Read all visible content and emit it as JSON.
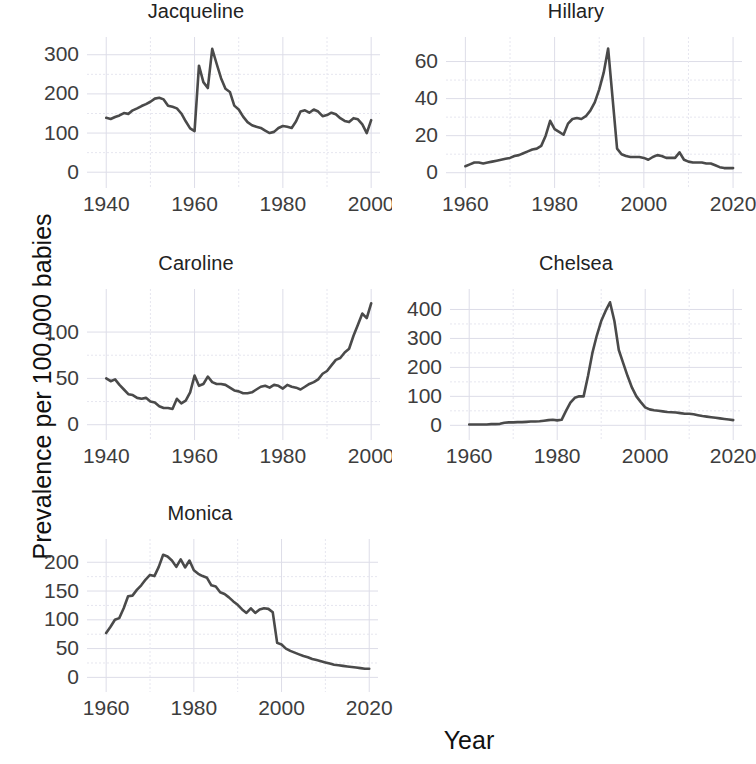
{
  "figure": {
    "xlabel": "Year",
    "ylabel": "Prevalence per 100,000 babies",
    "line_color": "#4a4a4a",
    "grid_color": "#e6e6ef",
    "background": "#ffffff"
  },
  "panels": [
    {
      "title": "Jacqueline"
    },
    {
      "title": "Hillary"
    },
    {
      "title": "Caroline"
    },
    {
      "title": "Chelsea"
    },
    {
      "title": "Monica"
    }
  ],
  "chart_data": [
    {
      "type": "line",
      "title": "Jacqueline",
      "xlabel": "Year",
      "ylabel": "Prevalence per 100,000 babies",
      "xlim": [
        1937,
        2002
      ],
      "ylim": [
        -25,
        330
      ],
      "xticks": [
        1940,
        1960,
        1980,
        2000
      ],
      "yticks": [
        0,
        100,
        200,
        300
      ],
      "grid": true,
      "legend": "none",
      "x": [
        1940,
        1941,
        1942,
        1943,
        1944,
        1945,
        1946,
        1947,
        1948,
        1949,
        1950,
        1951,
        1952,
        1953,
        1954,
        1955,
        1956,
        1957,
        1958,
        1959,
        1960,
        1961,
        1962,
        1963,
        1964,
        1965,
        1966,
        1967,
        1968,
        1969,
        1970,
        1971,
        1972,
        1973,
        1974,
        1975,
        1976,
        1977,
        1978,
        1979,
        1980,
        1981,
        1982,
        1983,
        1984,
        1985,
        1986,
        1987,
        1988,
        1989,
        1990,
        1991,
        1992,
        1993,
        1994,
        1995,
        1996,
        1997,
        1998,
        1999,
        2000
      ],
      "values": [
        139,
        136,
        141,
        145,
        151,
        149,
        158,
        163,
        169,
        174,
        180,
        188,
        190,
        186,
        170,
        167,
        163,
        150,
        130,
        112,
        105,
        272,
        230,
        215,
        315,
        277,
        240,
        213,
        205,
        170,
        160,
        142,
        128,
        120,
        116,
        113,
        106,
        100,
        103,
        113,
        118,
        116,
        113,
        130,
        155,
        158,
        152,
        160,
        155,
        143,
        146,
        152,
        148,
        138,
        131,
        128,
        138,
        135,
        122,
        100,
        133
      ]
    },
    {
      "type": "line",
      "title": "Hillary",
      "xlabel": "Year",
      "ylabel": "Prevalence per 100,000 babies",
      "xlim": [
        1957,
        2022
      ],
      "ylim": [
        -5,
        70
      ],
      "xticks": [
        1960,
        1980,
        2000,
        2020
      ],
      "yticks": [
        0,
        20,
        40,
        60
      ],
      "grid": true,
      "legend": "none",
      "x": [
        1960,
        1961,
        1962,
        1963,
        1964,
        1965,
        1966,
        1967,
        1968,
        1969,
        1970,
        1971,
        1972,
        1973,
        1974,
        1975,
        1976,
        1977,
        1978,
        1979,
        1980,
        1981,
        1982,
        1983,
        1984,
        1985,
        1986,
        1987,
        1988,
        1989,
        1990,
        1991,
        1992,
        1993,
        1994,
        1995,
        1996,
        1997,
        1998,
        1999,
        2000,
        2001,
        2002,
        2003,
        2004,
        2005,
        2006,
        2007,
        2008,
        2009,
        2010,
        2011,
        2012,
        2013,
        2014,
        2015,
        2016,
        2017,
        2018,
        2019,
        2020
      ],
      "values": [
        3.5,
        4.5,
        5.5,
        5.5,
        5.0,
        5.5,
        6.0,
        6.5,
        7.0,
        7.5,
        8.0,
        9.0,
        9.5,
        10.5,
        11.5,
        12.5,
        13.0,
        14.5,
        20.0,
        28.0,
        23.5,
        22.0,
        20.5,
        26.5,
        29.0,
        29.5,
        29.0,
        30.5,
        33.5,
        38.0,
        45.0,
        54.0,
        67.0,
        40.0,
        13.0,
        10.0,
        9.0,
        8.5,
        8.5,
        8.5,
        8.0,
        7.0,
        8.5,
        9.5,
        9.0,
        8.0,
        8.0,
        8.0,
        11.0,
        7.0,
        6.0,
        5.5,
        5.5,
        5.5,
        5.0,
        5.0,
        4.0,
        3.0,
        2.5,
        2.5,
        2.5
      ]
    },
    {
      "type": "line",
      "title": "Caroline",
      "xlabel": "Year",
      "ylabel": "Prevalence per 100,000 babies",
      "xlim": [
        1937,
        2002
      ],
      "ylim": [
        -10,
        140
      ],
      "xticks": [
        1940,
        1960,
        1980,
        2000
      ],
      "yticks": [
        0,
        50,
        100
      ],
      "grid": true,
      "legend": "none",
      "x": [
        1940,
        1941,
        1942,
        1943,
        1944,
        1945,
        1946,
        1947,
        1948,
        1949,
        1950,
        1951,
        1952,
        1953,
        1954,
        1955,
        1956,
        1957,
        1958,
        1959,
        1960,
        1961,
        1962,
        1963,
        1964,
        1965,
        1966,
        1967,
        1968,
        1969,
        1970,
        1971,
        1972,
        1973,
        1974,
        1975,
        1976,
        1977,
        1978,
        1979,
        1980,
        1981,
        1982,
        1983,
        1984,
        1985,
        1986,
        1987,
        1988,
        1989,
        1990,
        1991,
        1992,
        1993,
        1994,
        1995,
        1996,
        1997,
        1998,
        1999,
        2000
      ],
      "values": [
        50,
        47,
        49,
        43,
        38,
        33,
        32,
        29,
        28,
        29,
        25,
        24,
        20,
        18,
        18,
        17,
        28,
        23,
        26,
        35,
        53,
        42,
        44,
        52,
        46,
        44,
        44,
        43,
        40,
        37,
        36,
        34,
        34,
        35,
        38,
        41,
        42,
        40,
        43,
        42,
        39,
        43,
        41,
        40,
        38,
        41,
        44,
        46,
        49,
        55,
        58,
        64,
        70,
        72,
        78,
        82,
        96,
        108,
        120,
        115,
        131
      ]
    },
    {
      "type": "line",
      "title": "Chelsea",
      "xlabel": "Year",
      "ylabel": "Prevalence per 100,000 babies",
      "xlim": [
        1957,
        2022
      ],
      "ylim": [
        -30,
        450
      ],
      "xticks": [
        1960,
        1980,
        2000,
        2020
      ],
      "yticks": [
        0,
        100,
        200,
        300,
        400
      ],
      "grid": true,
      "legend": "none",
      "x": [
        1960,
        1961,
        1962,
        1963,
        1964,
        1965,
        1966,
        1967,
        1968,
        1969,
        1970,
        1971,
        1972,
        1973,
        1974,
        1975,
        1976,
        1977,
        1978,
        1979,
        1980,
        1981,
        1982,
        1983,
        1984,
        1985,
        1986,
        1987,
        1988,
        1989,
        1990,
        1991,
        1992,
        1993,
        1994,
        1995,
        1996,
        1997,
        1998,
        1999,
        2000,
        2001,
        2002,
        2003,
        2004,
        2005,
        2006,
        2007,
        2008,
        2009,
        2010,
        2011,
        2012,
        2013,
        2014,
        2015,
        2016,
        2017,
        2018,
        2019,
        2020
      ],
      "values": [
        3,
        3,
        3,
        3,
        3,
        4,
        4,
        5,
        9,
        10,
        10,
        11,
        11,
        12,
        13,
        13,
        14,
        16,
        18,
        19,
        17,
        19,
        50,
        78,
        95,
        100,
        100,
        170,
        250,
        310,
        360,
        395,
        425,
        360,
        260,
        215,
        170,
        130,
        100,
        80,
        62,
        55,
        52,
        50,
        48,
        46,
        45,
        44,
        42,
        40,
        40,
        38,
        35,
        32,
        30,
        28,
        26,
        24,
        22,
        20,
        18
      ]
    },
    {
      "type": "line",
      "title": "Monica",
      "xlabel": "Year",
      "ylabel": "Prevalence per 100,000 babies",
      "xlim": [
        1957,
        2022
      ],
      "ylim": [
        -15,
        230
      ],
      "xticks": [
        1960,
        1980,
        2000,
        2020
      ],
      "yticks": [
        0,
        50,
        100,
        150,
        200
      ],
      "grid": true,
      "legend": "none",
      "x": [
        1960,
        1961,
        1962,
        1963,
        1964,
        1965,
        1966,
        1967,
        1968,
        1969,
        1970,
        1971,
        1972,
        1973,
        1974,
        1975,
        1976,
        1977,
        1978,
        1979,
        1980,
        1981,
        1982,
        1983,
        1984,
        1985,
        1986,
        1987,
        1988,
        1989,
        1990,
        1991,
        1992,
        1993,
        1994,
        1995,
        1996,
        1997,
        1998,
        1999,
        2000,
        2001,
        2002,
        2003,
        2004,
        2005,
        2006,
        2007,
        2008,
        2009,
        2010,
        2011,
        2012,
        2013,
        2014,
        2015,
        2016,
        2017,
        2018,
        2019,
        2020
      ],
      "values": [
        77,
        88,
        100,
        103,
        120,
        141,
        142,
        152,
        160,
        170,
        178,
        176,
        192,
        213,
        210,
        203,
        192,
        205,
        191,
        203,
        186,
        180,
        176,
        173,
        160,
        158,
        148,
        145,
        139,
        132,
        126,
        118,
        112,
        120,
        112,
        118,
        120,
        119,
        113,
        60,
        57,
        50,
        46,
        43,
        40,
        37,
        35,
        32,
        30,
        28,
        26,
        24,
        22,
        21,
        20,
        19,
        18,
        17,
        16,
        15,
        15
      ]
    }
  ]
}
